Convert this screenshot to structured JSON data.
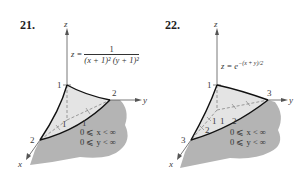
{
  "figures": [
    {
      "number": "21.",
      "equation": {
        "lhs": "z =",
        "numerator": "1",
        "denominator": "(x + 1)² (y + 1)²"
      },
      "axes": {
        "x": "x",
        "y": "y",
        "z": "z"
      },
      "ticks": {
        "z_top": "1",
        "x_corner": "2",
        "y_corner": "2",
        "x_inner": "1",
        "y_inner": "1"
      },
      "domain": [
        "0 ⩽ x < ∞",
        "0 ⩽ y < ∞"
      ]
    },
    {
      "number": "22.",
      "equation": {
        "lhs": "z = e",
        "exponent": "−(x + y)/2"
      },
      "axes": {
        "x": "x",
        "y": "y",
        "z": "z"
      },
      "ticks": {
        "z_top": "1",
        "x_corner": "3",
        "y_corner": "3",
        "x_inner1": "1",
        "x_inner2": "2",
        "y_inner1": "1",
        "y_inner2": "2"
      },
      "domain": [
        "0 ⩽ x < ∞",
        "0 ⩽ y < ∞"
      ]
    }
  ],
  "colors": {
    "surface_fill": "#e4e4e4",
    "region_fill": "#b4b4b4",
    "edge": "#111111",
    "axis": "#555555"
  }
}
